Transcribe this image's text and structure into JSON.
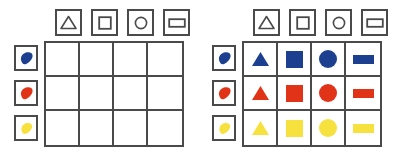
{
  "diagram": {
    "colors": {
      "outline": "#4a4a4a",
      "blue": "#1d3f8f",
      "red": "#e03318",
      "yellow": "#f7e13f",
      "background": "#ffffff"
    },
    "column_headers": [
      {
        "icon": "triangle-outline-icon",
        "label": "triangle"
      },
      {
        "icon": "square-outline-icon",
        "label": "square"
      },
      {
        "icon": "circle-outline-icon",
        "label": "circle"
      },
      {
        "icon": "rectangle-outline-icon",
        "label": "rectangle"
      }
    ],
    "row_headers": [
      {
        "icon": "blue-paint-blob-icon",
        "label": "blue",
        "color": "#1d3f8f"
      },
      {
        "icon": "red-paint-blob-icon",
        "label": "red",
        "color": "#e03318"
      },
      {
        "icon": "yellow-paint-blob-icon",
        "label": "yellow",
        "color": "#f7e13f"
      }
    ],
    "panels": [
      {
        "name": "empty-grid",
        "filled": false,
        "rows": [
          {
            "color": "blue",
            "cells": [
              null,
              null,
              null,
              null
            ]
          },
          {
            "color": "red",
            "cells": [
              null,
              null,
              null,
              null
            ]
          },
          {
            "color": "yellow",
            "cells": [
              null,
              null,
              null,
              null
            ]
          }
        ]
      },
      {
        "name": "filled-grid",
        "filled": true,
        "rows": [
          {
            "color": "blue",
            "cells": [
              "triangle",
              "square",
              "circle",
              "rectangle"
            ]
          },
          {
            "color": "red",
            "cells": [
              "triangle",
              "square",
              "circle",
              "rectangle"
            ]
          },
          {
            "color": "yellow",
            "cells": [
              "triangle",
              "square",
              "circle",
              "rectangle"
            ]
          }
        ]
      }
    ]
  }
}
